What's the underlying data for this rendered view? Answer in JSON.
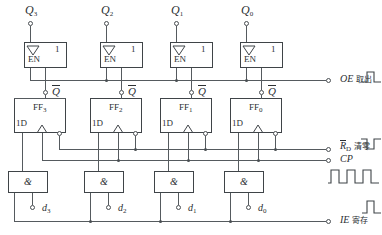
{
  "diagram": {
    "stroke_color": "#3f4448",
    "wire_color": "#555a5e"
  },
  "top_terminals": [
    {
      "name": "Q3",
      "label": "Q",
      "sub": "3"
    },
    {
      "name": "Q2",
      "label": "Q",
      "sub": "2"
    },
    {
      "name": "Q1",
      "label": "Q",
      "sub": "1"
    },
    {
      "name": "Q0",
      "label": "Q",
      "sub": "0"
    }
  ],
  "buffers": [
    {
      "name": "buffer-3",
      "en_label": "EN",
      "one_label": "1",
      "out_label": "Q"
    },
    {
      "name": "buffer-2",
      "en_label": "EN",
      "one_label": "1",
      "out_label": "Q"
    },
    {
      "name": "buffer-1",
      "en_label": "EN",
      "one_label": "1",
      "out_label": "Q"
    },
    {
      "name": "buffer-0",
      "en_label": "EN",
      "one_label": "1",
      "out_label": "Q"
    }
  ],
  "flipflops": [
    {
      "name": "ff-3",
      "label": "FF",
      "sub": "3",
      "d_label": "1D"
    },
    {
      "name": "ff-2",
      "label": "FF",
      "sub": "2",
      "d_label": "1D"
    },
    {
      "name": "ff-1",
      "label": "FF",
      "sub": "1",
      "d_label": "1D"
    },
    {
      "name": "ff-0",
      "label": "FF",
      "sub": "0",
      "d_label": "1D"
    }
  ],
  "and_gates": [
    {
      "name": "and-3",
      "symbol": "&"
    },
    {
      "name": "and-2",
      "symbol": "&"
    },
    {
      "name": "and-1",
      "symbol": "&"
    },
    {
      "name": "and-0",
      "symbol": "&"
    }
  ],
  "data_terminals": [
    {
      "name": "d3",
      "label": "d",
      "sub": "3"
    },
    {
      "name": "d2",
      "label": "d",
      "sub": "2"
    },
    {
      "name": "d1",
      "label": "d",
      "sub": "1"
    },
    {
      "name": "d0",
      "label": "d",
      "sub": "0"
    }
  ],
  "control_signals": [
    {
      "name": "OE",
      "signal": "OE",
      "cn": "取出",
      "overline": false,
      "sub": "",
      "waveform": "single-positive-pulse"
    },
    {
      "name": "RD",
      "signal": "R",
      "cn": "清零",
      "overline": true,
      "sub": "D",
      "waveform": "single-negative-pulse"
    },
    {
      "name": "CP",
      "signal": "CP",
      "cn": "",
      "overline": false,
      "sub": "",
      "waveform": "clock-train"
    },
    {
      "name": "IE",
      "signal": "IE",
      "cn": "寄存",
      "overline": false,
      "sub": "",
      "waveform": "single-positive-pulse"
    }
  ],
  "qbar_labels": [
    "Q",
    "Q",
    "Q",
    "Q"
  ]
}
